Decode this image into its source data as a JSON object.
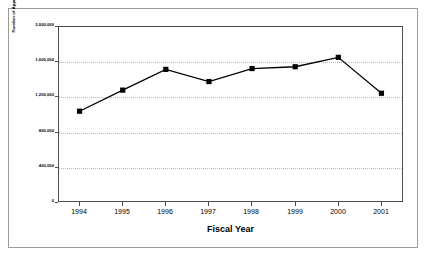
{
  "chart_data": {
    "type": "line",
    "title": "",
    "xlabel": "Fiscal Year",
    "ylabel": "Number of Apprehensions",
    "categories": [
      "1994",
      "1995",
      "1996",
      "1997",
      "1998",
      "1999",
      "2000",
      "2001"
    ],
    "values": [
      1031668,
      1271390,
      1507020,
      1368707,
      1516680,
      1537000,
      1643679,
      1235718
    ],
    "series": [
      {
        "name": "Number of Apprehensions",
        "values": [
          1031668,
          1271390,
          1507020,
          1368707,
          1516680,
          1537000,
          1643679,
          1235718
        ]
      }
    ],
    "ylim": [
      0,
      2000000
    ],
    "ytick_labels": [
      "2,000,000",
      "1,600,000",
      "1,200,000",
      "800,000",
      "400,000",
      "0"
    ],
    "ytick_values": [
      2000000,
      1600000,
      1200000,
      800000,
      400000,
      0
    ],
    "xtick_labels": [
      "1994",
      "1995",
      "1996",
      "1997",
      "1998",
      "1999",
      "2000",
      "2001"
    ],
    "grid": "horizontal-dotted",
    "legend": "none",
    "marker": "square",
    "marker_color": "#000000",
    "line_color": "#000000"
  },
  "axis": {
    "y_title": "Number of Apprehensions",
    "x_title": "Fiscal Year",
    "ticks_y": [
      {
        "label": "2,000,000",
        "value": 2000000
      },
      {
        "label": "1,600,000",
        "value": 1600000
      },
      {
        "label": "1,200,000",
        "value": 1200000
      },
      {
        "label": "800,000",
        "value": 800000
      },
      {
        "label": "400,000",
        "value": 400000
      },
      {
        "label": "0",
        "value": 0
      }
    ],
    "ticks_x": [
      {
        "label": "1994"
      },
      {
        "label": "1995"
      },
      {
        "label": "1996"
      },
      {
        "label": "1997"
      },
      {
        "label": "1998"
      },
      {
        "label": "1999"
      },
      {
        "label": "2000"
      },
      {
        "label": "2001"
      }
    ]
  },
  "colors": {
    "line": "#000000",
    "marker": "#000000",
    "grid": "#b9b9b9",
    "axis": "#4d4d4d",
    "frame": "#9a9a9a",
    "background": "#ffffff"
  }
}
